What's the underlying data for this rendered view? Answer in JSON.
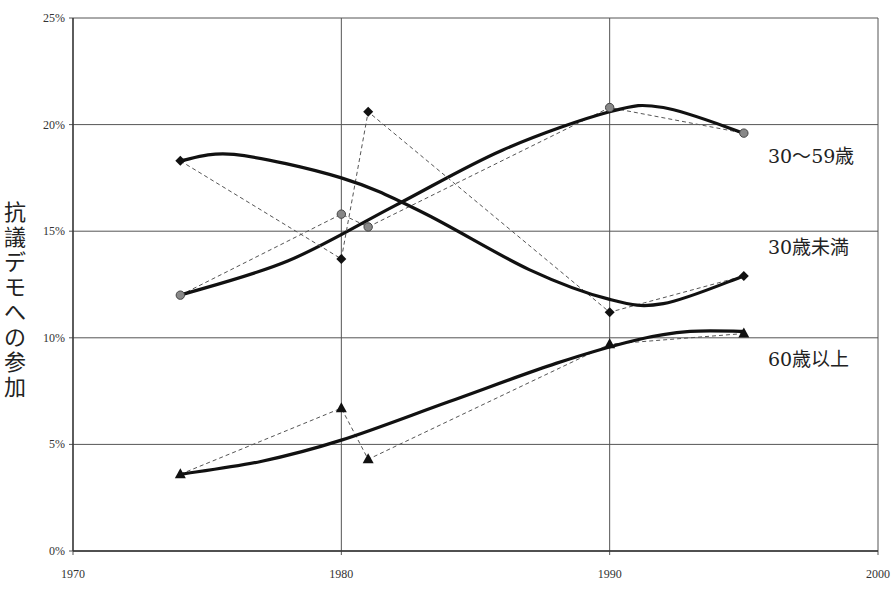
{
  "chart_data": {
    "type": "line",
    "title": "",
    "xlabel": "",
    "ylabel": "抗議デモへの参加",
    "xlim": [
      1970,
      2000
    ],
    "ylim": [
      0,
      25
    ],
    "x_ticks": [
      "1970",
      "1980",
      "1990",
      "2000"
    ],
    "y_ticks": [
      "0%",
      "5%",
      "10%",
      "15%",
      "20%",
      "25%"
    ],
    "grid": true,
    "legend_position": "inline-right",
    "series": [
      {
        "name": "30〜59歳",
        "marker": "circle",
        "x": [
          1974,
          1980,
          1981,
          1990,
          1995
        ],
        "values": [
          12.0,
          15.8,
          15.2,
          20.8,
          19.6
        ],
        "trend": [
          [
            1974,
            12.0
          ],
          [
            1978,
            13.6
          ],
          [
            1982,
            16.2
          ],
          [
            1986,
            18.8
          ],
          [
            1990,
            20.6
          ],
          [
            1992,
            20.8
          ],
          [
            1995,
            19.6
          ]
        ],
        "label_pos": [
          768,
          163
        ]
      },
      {
        "name": "30歳未満",
        "marker": "diamond",
        "x": [
          1974,
          1980,
          1981,
          1990,
          1995
        ],
        "values": [
          18.3,
          13.7,
          20.6,
          11.2,
          12.9
        ],
        "trend": [
          [
            1974,
            18.3
          ],
          [
            1976,
            18.6
          ],
          [
            1980,
            17.5
          ],
          [
            1983,
            15.9
          ],
          [
            1987,
            13.2
          ],
          [
            1990,
            11.8
          ],
          [
            1992,
            11.6
          ],
          [
            1995,
            12.9
          ]
        ],
        "label_pos": [
          768,
          254
        ]
      },
      {
        "name": "60歳以上",
        "marker": "triangle",
        "x": [
          1974,
          1980,
          1981,
          1990,
          1995
        ],
        "values": [
          3.6,
          6.7,
          4.3,
          9.7,
          10.2
        ],
        "trend": [
          [
            1974,
            3.6
          ],
          [
            1977,
            4.2
          ],
          [
            1980,
            5.2
          ],
          [
            1984,
            7.0
          ],
          [
            1988,
            8.8
          ],
          [
            1991,
            9.9
          ],
          [
            1993,
            10.3
          ],
          [
            1995,
            10.3
          ]
        ],
        "label_pos": [
          768,
          366
        ]
      }
    ]
  },
  "axis": {
    "ylabel_chars": [
      "抗",
      "議",
      "デ",
      "モ",
      "へ",
      "の",
      "参",
      "加"
    ]
  }
}
